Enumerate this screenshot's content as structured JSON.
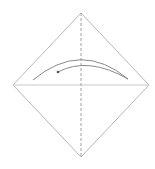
{
  "diagram": {
    "type": "origami-fold-step",
    "colors": {
      "background": "#ffffff",
      "paper_edge": "#b8b8b8",
      "crease": "#c8c8c8",
      "fold_line": "#a0a0a0",
      "arrow": "#8a8a8a",
      "dot": "#555555"
    },
    "paper": {
      "top": [
        81,
        13
      ],
      "right": [
        149,
        85
      ],
      "bottom": [
        81,
        157
      ],
      "left": [
        13,
        85
      ]
    },
    "horizontal_crease": {
      "from": [
        13,
        85
      ],
      "to": [
        149,
        85
      ]
    },
    "vertical_fold_line": {
      "from": [
        81,
        13
      ],
      "to": [
        81,
        157
      ],
      "style": "dashed"
    },
    "arrow": {
      "outer_path": "M33,80 Q81,40 128,79",
      "inner_path": "M128,79 Q88,56 58,72",
      "dot": [
        58,
        72
      ]
    }
  }
}
